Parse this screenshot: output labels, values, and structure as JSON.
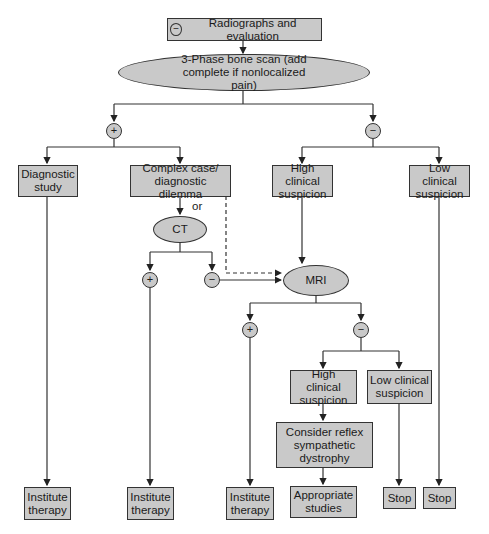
{
  "nodes": {
    "start": {
      "sign": "−",
      "label": "Radiographs and evaluation"
    },
    "bone_scan": {
      "label": "3-Phase bone scan (add complete if nonlocalized pain)"
    },
    "diagnostic_study": {
      "label": "Diagnostic study"
    },
    "complex_case": {
      "label": "Complex case/ diagnostic dilemma"
    },
    "high_clinical_1": {
      "label": "High clinical suspicion"
    },
    "low_clinical_1": {
      "label": "Low clinical suspicion"
    },
    "ct": {
      "label": "CT"
    },
    "mri": {
      "label": "MRI"
    },
    "high_clinical_2": {
      "label": "High clinical suspicion"
    },
    "low_clinical_2": {
      "label": "Low clinical suspicion"
    },
    "consider_rsd": {
      "label": "Consider reflex sympathetic dystrophy"
    },
    "institute_therapy_1": {
      "label": "Institute therapy"
    },
    "institute_therapy_2": {
      "label": "Institute therapy"
    },
    "institute_therapy_3": {
      "label": "Institute therapy"
    },
    "appropriate_studies": {
      "label": "Appropriate studies"
    },
    "stop_1": {
      "label": "Stop"
    },
    "stop_2": {
      "label": "Stop"
    }
  },
  "signs": {
    "plus": "+",
    "minus": "−"
  },
  "connector_labels": {
    "or": "or"
  },
  "colors": {
    "node_fill": "#c9c9c9",
    "stroke": "#333333"
  }
}
